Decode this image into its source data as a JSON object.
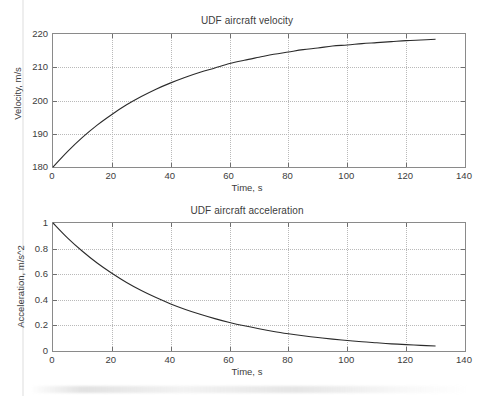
{
  "figure": {
    "background": "#ffffff",
    "axis_color": "#8a8a8a",
    "grid_color": "#b9b9b9",
    "curve_color": "#2b2b2b"
  },
  "chart_data": [
    {
      "type": "line",
      "id": "velocity",
      "title": "UDF aircraft velocity",
      "xlabel": "Time, s",
      "ylabel": "Velocity, m/s",
      "xlim": [
        0,
        140
      ],
      "ylim": [
        180,
        220
      ],
      "xticks": [
        0,
        20,
        40,
        60,
        80,
        100,
        120,
        140
      ],
      "xticklabels": [
        "0",
        "20",
        "40",
        "60",
        "80",
        "100",
        "120",
        "140"
      ],
      "yticks": [
        180,
        190,
        200,
        210,
        220
      ],
      "yticklabels": [
        "180",
        "190",
        "200",
        "210",
        "220"
      ],
      "grid": true,
      "legend": "none",
      "series": [
        {
          "name": "velocity",
          "x": [
            0,
            5,
            10,
            15,
            20,
            25,
            30,
            35,
            40,
            45,
            50,
            55,
            60,
            65,
            70,
            75,
            80,
            85,
            90,
            95,
            100,
            105,
            110,
            115,
            120,
            125,
            130
          ],
          "values": [
            180.0,
            184.7,
            188.9,
            192.6,
            195.8,
            198.7,
            201.2,
            203.4,
            205.3,
            207.0,
            208.5,
            209.8,
            211.1,
            212.1,
            213.0,
            213.9,
            214.6,
            215.3,
            215.8,
            216.4,
            216.7,
            217.1,
            217.4,
            217.7,
            218.0,
            218.2,
            218.4
          ]
        }
      ],
      "model": "v(t) = 220 - 40*exp(-t/40)"
    },
    {
      "type": "line",
      "id": "acceleration",
      "title": "UDF aircraft acceleration",
      "xlabel": "Time, s",
      "ylabel": "Acceleration, m/s^2",
      "xlim": [
        0,
        140
      ],
      "ylim": [
        0,
        1
      ],
      "xticks": [
        0,
        20,
        40,
        60,
        80,
        100,
        120,
        140
      ],
      "xticklabels": [
        "0",
        "20",
        "40",
        "60",
        "80",
        "100",
        "120",
        "140"
      ],
      "yticks": [
        0,
        0.2,
        0.4,
        0.6,
        0.8,
        1
      ],
      "yticklabels": [
        "0",
        "0.2",
        "0.4",
        "0.6",
        "0.8",
        "1"
      ],
      "grid": true,
      "legend": "none",
      "series": [
        {
          "name": "acceleration",
          "x": [
            0,
            5,
            10,
            15,
            20,
            25,
            30,
            35,
            40,
            45,
            50,
            55,
            60,
            65,
            70,
            75,
            80,
            85,
            90,
            95,
            100,
            105,
            110,
            115,
            120,
            125,
            130
          ],
          "values": [
            1.0,
            0.882,
            0.779,
            0.687,
            0.607,
            0.535,
            0.472,
            0.417,
            0.368,
            0.325,
            0.287,
            0.253,
            0.223,
            0.197,
            0.174,
            0.153,
            0.135,
            0.119,
            0.105,
            0.093,
            0.082,
            0.072,
            0.064,
            0.056,
            0.05,
            0.044,
            0.039
          ]
        }
      ],
      "model": "a(t) = exp(-t/40)"
    }
  ]
}
